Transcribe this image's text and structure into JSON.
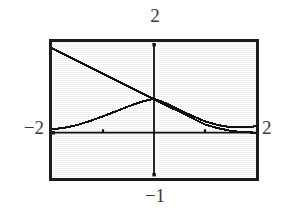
{
  "figure": {
    "kind": "graphing-calculator-screen",
    "background_color": "#ededed",
    "frame_color": "#1c1c1c",
    "trace_color": "#111111"
  },
  "labels": {
    "top": "2",
    "bottom": "−1",
    "left": "−2",
    "right": "2"
  },
  "chart_data": {
    "type": "line",
    "title": "",
    "subtitle": "",
    "xlabel": "",
    "ylabel": "",
    "grid": false,
    "legend": "none",
    "xlim": [
      -2,
      2
    ],
    "ylim": [
      -1,
      2
    ],
    "xticks": [
      -1,
      1
    ],
    "yticks": [],
    "axis_lines": {
      "x_axis_at_y": 0,
      "y_axis_at_x": 0
    },
    "window_labels": {
      "xmin": "−2",
      "xmax": "2",
      "ymax": "2",
      "ymin": "−1"
    },
    "series": [
      {
        "name": "descending-line",
        "style": "solid",
        "color": "#111111",
        "x": [
          -2.0,
          -1.75,
          -1.5,
          -1.25,
          -1.0,
          -0.75,
          -0.5,
          -0.25,
          0.0,
          0.25,
          0.5,
          0.75,
          1.0,
          1.25,
          1.5,
          1.75,
          2.0
        ],
        "y": [
          1.86,
          1.72,
          1.58,
          1.44,
          1.3,
          1.16,
          1.02,
          0.88,
          0.74,
          0.6,
          0.46,
          0.32,
          0.18,
          0.1,
          0.04,
          0.01,
          0.0
        ]
      },
      {
        "name": "rising-peaking-curve",
        "style": "solid",
        "color": "#111111",
        "x": [
          -2.0,
          -1.75,
          -1.5,
          -1.25,
          -1.0,
          -0.75,
          -0.5,
          -0.25,
          0.0,
          0.25,
          0.5,
          0.75,
          1.0,
          1.25,
          1.5,
          1.75,
          2.0
        ],
        "y": [
          0.07,
          0.11,
          0.17,
          0.26,
          0.36,
          0.47,
          0.58,
          0.68,
          0.75,
          0.64,
          0.5,
          0.37,
          0.25,
          0.17,
          0.12,
          0.12,
          0.14
        ]
      }
    ],
    "annotations": [
      {
        "text": "curves intersect near x = 0",
        "x": 0.0,
        "y": 0.75
      }
    ]
  }
}
